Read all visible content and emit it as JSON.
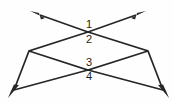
{
  "figure": {
    "background_color": "#fefefe",
    "stroke_color": "#262626",
    "label_color": "#1c1c1c",
    "width": 173,
    "height": 102,
    "lines": [
      {
        "name": "line-upper-left-to-lower-right",
        "description": "Double-headed ray from upper-left arrowhead through top vertex and right rhombus vertex to lower-right arrowhead",
        "points": "38,14 88,32 148,51 165,92",
        "arrow_start": true,
        "arrow_end": true
      },
      {
        "name": "line-upper-right-to-lower-left",
        "description": "Double-headed ray from upper-right arrowhead through top vertex and left rhombus vertex to lower-left arrowhead",
        "points": "138,14 88,32 29,51 12,92",
        "arrow_start": true,
        "arrow_end": true
      },
      {
        "name": "rhombus-lower-left-edge",
        "description": "Segment from left rhombus vertex down-right to bottom crossing point",
        "points": "29,51 148,51",
        "arrow_start": false,
        "arrow_end": false
      }
    ],
    "vertices": [
      {
        "name": "top-crossing-point",
        "x": 88,
        "y": 32
      },
      {
        "name": "bottom-crossing-point",
        "x": 88,
        "y": 70
      },
      {
        "name": "left-rhombus-vertex",
        "x": 29,
        "y": 51
      },
      {
        "name": "right-rhombus-vertex",
        "x": 148,
        "y": 51
      }
    ],
    "labels": [
      {
        "name": "angle-label-1",
        "text": "1",
        "x": 82,
        "y": 19
      },
      {
        "name": "angle-label-2",
        "text": "2",
        "x": 82,
        "y": 34
      },
      {
        "name": "angle-label-3",
        "text": "3",
        "x": 82,
        "y": 57
      },
      {
        "name": "angle-label-4",
        "text": "4",
        "x": 82,
        "y": 71
      }
    ]
  }
}
